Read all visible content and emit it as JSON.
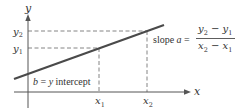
{
  "diagram": {
    "type": "linear-function-graph",
    "axes": {
      "x_label": "x",
      "y_label": "y"
    },
    "ticks": {
      "x1": {
        "base": "x",
        "sub": "1"
      },
      "x2": {
        "base": "x",
        "sub": "2"
      },
      "y1": {
        "base": "y",
        "sub": "1"
      },
      "y2": {
        "base": "y",
        "sub": "2"
      }
    },
    "annotations": {
      "intercept_label": "b = y intercept",
      "intercept_b": "b",
      "intercept_eq": " = ",
      "intercept_y": "y",
      "intercept_rest": " intercept",
      "slope_prefix": "slope ",
      "slope_var": "a",
      "slope_eq": " =",
      "slope_numerator": "y2 − y1",
      "slope_denominator": "x2 − x1",
      "minus": " − "
    },
    "colors": {
      "line": "#4a4a4a",
      "axes": "#555555",
      "dashed": "#777777",
      "text": "#333333"
    }
  }
}
